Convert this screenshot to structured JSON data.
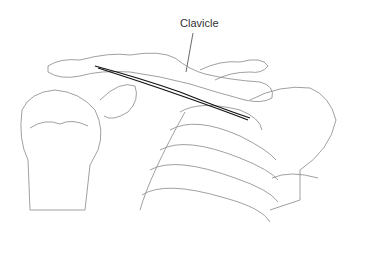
{
  "figure": {
    "labels": [
      {
        "text": "Clavicle",
        "target": "clavicle"
      }
    ]
  },
  "colors": {
    "background": "#ffffff",
    "line": "#777777",
    "highlight": "#111111",
    "label": "#333333"
  }
}
